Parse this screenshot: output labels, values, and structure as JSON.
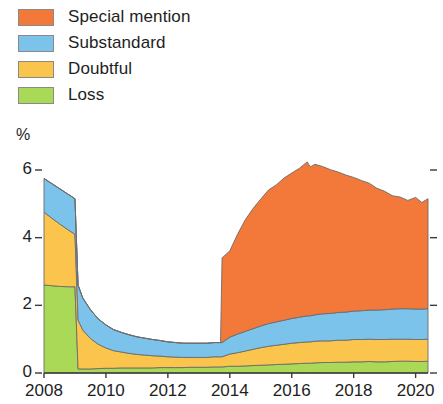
{
  "legend": {
    "position": "top-left",
    "items": [
      {
        "label": "Special mention",
        "color": "#F3793B",
        "key": "special_mention"
      },
      {
        "label": "Substandard",
        "color": "#7CC3EC",
        "key": "substandard"
      },
      {
        "label": "Doubtful",
        "color": "#FBC54D",
        "key": "doubtful"
      },
      {
        "label": "Loss",
        "color": "#A9D957",
        "key": "loss"
      }
    ]
  },
  "axes": {
    "y_unit": "%",
    "y_ticks": [
      "0",
      "2",
      "4",
      "6"
    ],
    "x_ticks": [
      "2008",
      "2010",
      "2012",
      "2014",
      "2016",
      "2018",
      "2020"
    ]
  },
  "chart_data": {
    "type": "area",
    "stacked": true,
    "title": "",
    "subtitle": "",
    "xlabel": "",
    "ylabel": "%",
    "ylim": [
      0,
      6
    ],
    "xlim": [
      2008,
      2020.4
    ],
    "grid": false,
    "legend_position": "top-left",
    "axis_note": "stacking order bottom-to-top: Loss, Doubtful, Substandard, Special mention",
    "x": [
      2008.0,
      2008.25,
      2008.5,
      2008.75,
      2009.0,
      2009.1,
      2009.25,
      2009.5,
      2009.75,
      2010.0,
      2010.25,
      2010.5,
      2010.75,
      2011.0,
      2011.25,
      2011.5,
      2011.75,
      2012.0,
      2012.25,
      2012.5,
      2012.75,
      2013.0,
      2013.25,
      2013.5,
      2013.7,
      2013.75,
      2014.0,
      2014.25,
      2014.5,
      2014.75,
      2015.0,
      2015.25,
      2015.5,
      2015.75,
      2016.0,
      2016.25,
      2016.5,
      2016.6,
      2016.75,
      2017.0,
      2017.25,
      2017.5,
      2017.75,
      2018.0,
      2018.25,
      2018.5,
      2018.75,
      2019.0,
      2019.25,
      2019.5,
      2019.75,
      2020.0,
      2020.2,
      2020.4
    ],
    "series": [
      {
        "name": "Loss",
        "color": "#A9D957",
        "values": [
          2.6,
          2.58,
          2.56,
          2.55,
          2.55,
          0.12,
          0.12,
          0.12,
          0.13,
          0.14,
          0.14,
          0.15,
          0.15,
          0.15,
          0.15,
          0.15,
          0.16,
          0.16,
          0.16,
          0.16,
          0.17,
          0.17,
          0.17,
          0.18,
          0.18,
          0.18,
          0.2,
          0.2,
          0.21,
          0.22,
          0.23,
          0.24,
          0.25,
          0.26,
          0.27,
          0.28,
          0.29,
          0.29,
          0.3,
          0.31,
          0.31,
          0.32,
          0.32,
          0.33,
          0.33,
          0.34,
          0.33,
          0.33,
          0.34,
          0.35,
          0.35,
          0.34,
          0.34,
          0.35
        ]
      },
      {
        "name": "Doubtful",
        "color": "#FBC54D",
        "values": [
          2.15,
          2.0,
          1.85,
          1.7,
          1.55,
          1.45,
          1.15,
          0.9,
          0.72,
          0.6,
          0.52,
          0.47,
          0.43,
          0.4,
          0.38,
          0.36,
          0.34,
          0.32,
          0.31,
          0.3,
          0.29,
          0.29,
          0.29,
          0.3,
          0.3,
          0.3,
          0.36,
          0.4,
          0.44,
          0.48,
          0.52,
          0.55,
          0.57,
          0.59,
          0.61,
          0.62,
          0.63,
          0.63,
          0.64,
          0.64,
          0.64,
          0.65,
          0.65,
          0.66,
          0.66,
          0.66,
          0.66,
          0.66,
          0.66,
          0.65,
          0.65,
          0.65,
          0.65,
          0.65
        ]
      },
      {
        "name": "Substandard",
        "color": "#7CC3EC",
        "values": [
          1.0,
          1.02,
          1.04,
          1.05,
          1.05,
          1.03,
          0.95,
          0.85,
          0.75,
          0.68,
          0.62,
          0.58,
          0.55,
          0.52,
          0.5,
          0.48,
          0.46,
          0.44,
          0.43,
          0.42,
          0.42,
          0.42,
          0.42,
          0.42,
          0.42,
          0.42,
          0.5,
          0.55,
          0.58,
          0.61,
          0.64,
          0.67,
          0.69,
          0.71,
          0.73,
          0.75,
          0.77,
          0.77,
          0.78,
          0.8,
          0.81,
          0.82,
          0.83,
          0.84,
          0.85,
          0.86,
          0.87,
          0.88,
          0.89,
          0.9,
          0.9,
          0.9,
          0.9,
          0.9
        ]
      },
      {
        "name": "Special mention",
        "color": "#F3793B",
        "values": [
          0,
          0,
          0,
          0,
          0,
          0,
          0,
          0,
          0,
          0,
          0,
          0,
          0,
          0,
          0,
          0,
          0,
          0,
          0,
          0,
          0,
          0,
          0,
          0,
          0,
          2.5,
          2.55,
          2.95,
          3.3,
          3.55,
          3.75,
          3.95,
          4.05,
          4.2,
          4.3,
          4.4,
          4.55,
          4.4,
          4.45,
          4.35,
          4.25,
          4.15,
          4.05,
          3.95,
          3.85,
          3.75,
          3.6,
          3.5,
          3.35,
          3.3,
          3.2,
          3.3,
          3.15,
          3.25
        ]
      }
    ]
  }
}
